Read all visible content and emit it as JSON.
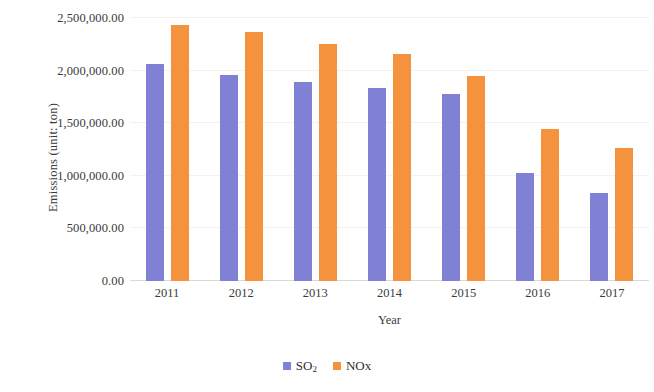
{
  "chart_data": {
    "type": "bar",
    "title": "",
    "xlabel": "Year",
    "ylabel": "Emissions (unit: ton)",
    "categories": [
      "2011",
      "2012",
      "2013",
      "2014",
      "2015",
      "2016",
      "2017"
    ],
    "series": [
      {
        "name": "SO2",
        "legend_label": "SO",
        "legend_subscript": "2",
        "color": "#8080d4",
        "values": [
          2060000,
          1960000,
          1890000,
          1830000,
          1775000,
          1030000,
          835000
        ]
      },
      {
        "name": "NOx",
        "legend_label": "NOx",
        "legend_subscript": "",
        "color": "#f5923e",
        "values": [
          2430000,
          2365000,
          2250000,
          2160000,
          1950000,
          1445000,
          1265000
        ]
      }
    ],
    "ylim": [
      0,
      2500000
    ],
    "ytick_values": [
      0,
      500000,
      1000000,
      1500000,
      2000000,
      2500000
    ],
    "ytick_labels": [
      "0.00",
      "500,000.00",
      "1,000,000.00",
      "1,500,000.00",
      "2,000,000.00",
      "2,500,000.00"
    ],
    "grid": true,
    "legend_position": "bottom"
  }
}
